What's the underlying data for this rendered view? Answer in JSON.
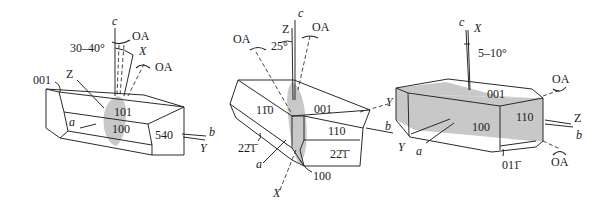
{
  "figure": {
    "shade_color": "#c8c8c8",
    "line_color": "#2a2a2a",
    "crystals": [
      {
        "id": "left",
        "labels": {
          "c_axis": "c",
          "angle": "30–40°",
          "oa_top": "OA",
          "x_dir": "X",
          "oa_right": "OA",
          "z_dir": "Z",
          "face_001": "001",
          "face_101": "101",
          "face_100": "100",
          "a_axis": "a",
          "face_540": "540",
          "b_axis": "b",
          "y_dir": "Y"
        }
      },
      {
        "id": "middle",
        "labels": {
          "c_axis": "c",
          "z_dir": "Z",
          "oa_left": "OA",
          "angle": "25°",
          "oa_right": "OA",
          "face_1-10": "11̄0",
          "face_001": "001",
          "face_110": "110",
          "face_22-1_left": "22̄1̄",
          "face_22-1_right": "22̄1̄",
          "a_axis": "a",
          "face_100": "100",
          "x_dir": "X",
          "y_dir": "Y",
          "b_axis": "b"
        }
      },
      {
        "id": "right",
        "labels": {
          "c_axis": "c",
          "x_dir": "X",
          "angle": "5–10°",
          "face_001": "001",
          "oa_top": "OA",
          "face_100": "100",
          "face_110": "110",
          "z_dir": "Z",
          "b_axis": "b",
          "y_dir": "Y",
          "a_axis": "a",
          "face_01-1": "011̄",
          "oa_bottom": "OA"
        }
      }
    ]
  }
}
